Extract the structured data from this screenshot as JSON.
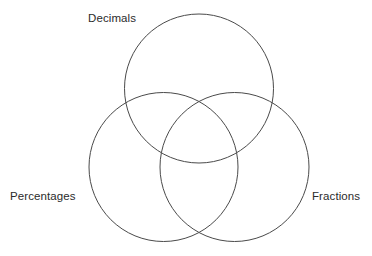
{
  "page": {
    "background_color": "#ffffff",
    "width": 372,
    "height": 256,
    "top_clipped_text": "                                    "
  },
  "diagram": {
    "type": "venn",
    "set_count": 3,
    "stroke_color": "#4a4a4a",
    "stroke_width": 1,
    "fill": "none",
    "text_color": "#2b2b2b",
    "sets": [
      {
        "id": "decimals",
        "label": "Decimals",
        "position": "top",
        "cx": 199,
        "cy": 88.5,
        "r": 74.5,
        "label_x": 88,
        "label_y": 13
      },
      {
        "id": "percentages",
        "label": "Percentages",
        "position": "bottom-left",
        "cx": 163.5,
        "cy": 167,
        "r": 74.5,
        "label_x": 10,
        "label_y": 191
      },
      {
        "id": "fractions",
        "label": "Fractions",
        "position": "bottom-right",
        "cx": 234.5,
        "cy": 167,
        "r": 74.5,
        "label_x": 312,
        "label_y": 191
      }
    ]
  }
}
